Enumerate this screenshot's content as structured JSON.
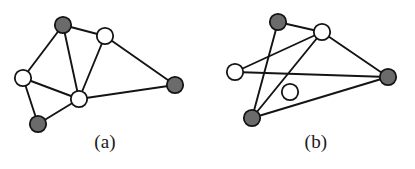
{
  "figure": {
    "width": 415,
    "height": 169,
    "background": "#ffffff",
    "caption_a": "(a)",
    "caption_b": "(b)"
  },
  "style": {
    "edge_color": "#141414",
    "edge_width": 1.9,
    "node_stroke": "#141414",
    "node_stroke_width": 1.8,
    "node_radius": 8.2,
    "fill_dark": "#6b6b6b",
    "fill_light": "#ffffff"
  },
  "graphs": [
    {
      "id": "graph-a",
      "label": "(a)",
      "nodes": [
        {
          "id": "a1",
          "name": "node-a-top-dark",
          "x": 63,
          "y": 25,
          "fill": "dark"
        },
        {
          "id": "a2",
          "name": "node-a-upper-right-light",
          "x": 105,
          "y": 36,
          "fill": "light"
        },
        {
          "id": "a3",
          "name": "node-a-left-light",
          "x": 23,
          "y": 78,
          "fill": "light"
        },
        {
          "id": "a4",
          "name": "node-a-center-light",
          "x": 79,
          "y": 99,
          "fill": "light"
        },
        {
          "id": "a5",
          "name": "node-a-bottom-dark",
          "x": 38,
          "y": 124,
          "fill": "dark"
        },
        {
          "id": "a6",
          "name": "node-a-right-dark",
          "x": 175,
          "y": 85,
          "fill": "dark"
        }
      ],
      "edges": [
        {
          "from": "a1",
          "to": "a2"
        },
        {
          "from": "a1",
          "to": "a3"
        },
        {
          "from": "a1",
          "to": "a4"
        },
        {
          "from": "a2",
          "to": "a4"
        },
        {
          "from": "a2",
          "to": "a6"
        },
        {
          "from": "a3",
          "to": "a4"
        },
        {
          "from": "a3",
          "to": "a5"
        },
        {
          "from": "a4",
          "to": "a5"
        },
        {
          "from": "a4",
          "to": "a6"
        }
      ]
    },
    {
      "id": "graph-b",
      "label": "(b)",
      "nodes": [
        {
          "id": "b1",
          "name": "node-b-top-dark",
          "x": 278,
          "y": 22,
          "fill": "dark"
        },
        {
          "id": "b2",
          "name": "node-b-upper-right-light",
          "x": 322,
          "y": 32,
          "fill": "light"
        },
        {
          "id": "b3",
          "name": "node-b-left-light",
          "x": 235,
          "y": 72,
          "fill": "light"
        },
        {
          "id": "b4",
          "name": "node-b-center-light",
          "x": 290,
          "y": 92,
          "fill": "light"
        },
        {
          "id": "b5",
          "name": "node-b-bottom-dark",
          "x": 252,
          "y": 118,
          "fill": "dark"
        },
        {
          "id": "b6",
          "name": "node-b-right-dark",
          "x": 388,
          "y": 77,
          "fill": "dark"
        }
      ],
      "edges": [
        {
          "from": "b1",
          "to": "b2"
        },
        {
          "from": "b1",
          "to": "b5"
        },
        {
          "from": "b2",
          "to": "b3"
        },
        {
          "from": "b2",
          "to": "b5"
        },
        {
          "from": "b2",
          "to": "b6"
        },
        {
          "from": "b3",
          "to": "b6"
        },
        {
          "from": "b5",
          "to": "b6"
        }
      ]
    }
  ]
}
